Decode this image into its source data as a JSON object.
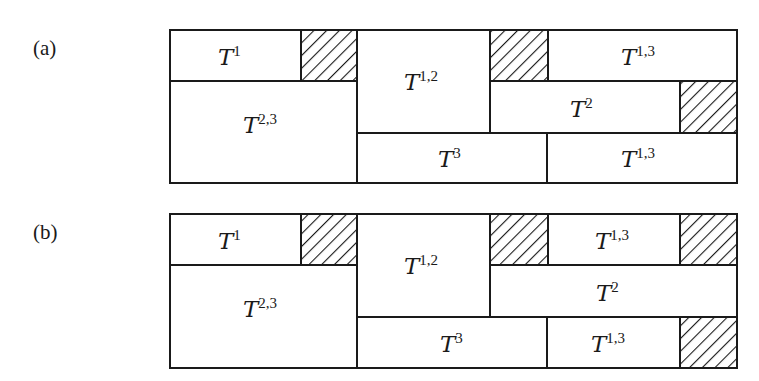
{
  "figure": {
    "panels": [
      {
        "label": "(a)",
        "cells": [
          {
            "id": "a-t1",
            "kind": "block",
            "base": "T",
            "sup": "1"
          },
          {
            "id": "a-h1",
            "kind": "hatched"
          },
          {
            "id": "a-t23",
            "kind": "block",
            "base": "T",
            "sup": "2,3"
          },
          {
            "id": "a-t12",
            "kind": "block",
            "base": "T",
            "sup": "1,2"
          },
          {
            "id": "a-h2",
            "kind": "hatched"
          },
          {
            "id": "a-t13-top",
            "kind": "block",
            "base": "T",
            "sup": "1,3"
          },
          {
            "id": "a-t2",
            "kind": "block",
            "base": "T",
            "sup": "2"
          },
          {
            "id": "a-h3",
            "kind": "hatched"
          },
          {
            "id": "a-t3",
            "kind": "block",
            "base": "T",
            "sup": "3"
          },
          {
            "id": "a-t13-bot",
            "kind": "block",
            "base": "T",
            "sup": "1,3"
          }
        ]
      },
      {
        "label": "(b)",
        "cells": [
          {
            "id": "b-t1",
            "kind": "block",
            "base": "T",
            "sup": "1"
          },
          {
            "id": "b-h1",
            "kind": "hatched"
          },
          {
            "id": "b-t23",
            "kind": "block",
            "base": "T",
            "sup": "2,3"
          },
          {
            "id": "b-t12",
            "kind": "block",
            "base": "T",
            "sup": "1,2"
          },
          {
            "id": "b-h2",
            "kind": "hatched"
          },
          {
            "id": "b-t13-top",
            "kind": "block",
            "base": "T",
            "sup": "1,3"
          },
          {
            "id": "b-h3",
            "kind": "hatched"
          },
          {
            "id": "b-t2",
            "kind": "block",
            "base": "T",
            "sup": "2"
          },
          {
            "id": "b-t3",
            "kind": "block",
            "base": "T",
            "sup": "3"
          },
          {
            "id": "b-t13-bot",
            "kind": "block",
            "base": "T",
            "sup": "1,3"
          },
          {
            "id": "b-h4",
            "kind": "hatched"
          }
        ]
      }
    ]
  }
}
